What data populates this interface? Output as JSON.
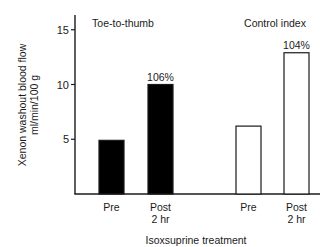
{
  "chart_data": {
    "type": "bar",
    "title": "",
    "xlabel": "Isoxsuprine treatment",
    "ylabel": "Xenon washout blood flow ml/min/100 g",
    "ylabel_lines": [
      "Xenon washout blood flow",
      "ml/min/100 g"
    ],
    "ylim": [
      0,
      16.5
    ],
    "yticks": [
      5,
      10,
      15
    ],
    "grid": false,
    "legend": null,
    "groups": [
      {
        "name": "Toe-to-thumb",
        "fill": "#000000",
        "bars": [
          {
            "label": "Pre",
            "label_lines": [
              "Pre"
            ],
            "value": 4.9
          },
          {
            "label": "Post 2 hr",
            "label_lines": [
              "Post",
              "2 hr"
            ],
            "value": 10.0,
            "annotation": "106%"
          }
        ]
      },
      {
        "name": "Control index",
        "fill": "#ffffff",
        "bars": [
          {
            "label": "Pre",
            "label_lines": [
              "Pre"
            ],
            "value": 6.2
          },
          {
            "label": "Post 2 hr",
            "label_lines": [
              "Post",
              "2 hr"
            ],
            "value": 12.9,
            "annotation": "104%"
          }
        ]
      }
    ],
    "categories": [
      "Toe-to-thumb Pre",
      "Toe-to-thumb Post 2 hr",
      "Control index Pre",
      "Control index Post 2 hr"
    ],
    "values": [
      4.9,
      10.0,
      6.2,
      12.9
    ]
  }
}
